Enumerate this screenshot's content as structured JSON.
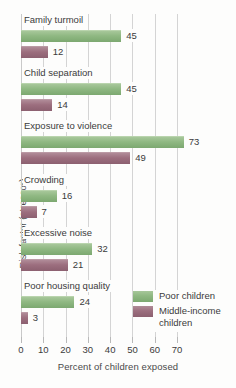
{
  "chart_data": {
    "type": "bar",
    "orientation": "horizontal",
    "title": "",
    "xlabel": "Percent of children exposed",
    "ylabel": "Risk factor (stressor)",
    "xlim": [
      0,
      70
    ],
    "xticks": [
      0,
      10,
      20,
      30,
      40,
      50,
      60,
      70
    ],
    "xtick_labels": [
      "0",
      "10",
      "20",
      "30",
      "40",
      "50",
      "60",
      "70"
    ],
    "grid": true,
    "grid_axis": "x",
    "legend_position": "lower-right",
    "categories": [
      "Family turmoil",
      "Child separation",
      "Exposure to violence",
      "Crowding",
      "Excessive noise",
      "Poor housing quality"
    ],
    "series": [
      {
        "name": "Poor children",
        "color": "#8fb882",
        "values": [
          45,
          45,
          73,
          16,
          32,
          24
        ]
      },
      {
        "name": "Middle-income children",
        "color": "#9c6e7e",
        "values": [
          12,
          14,
          49,
          7,
          21,
          3
        ]
      }
    ]
  },
  "legend": {
    "items": [
      {
        "label": "Poor children",
        "color": "#8fb882"
      },
      {
        "label": "Middle-income children",
        "color": "#9c6e7e"
      }
    ]
  }
}
